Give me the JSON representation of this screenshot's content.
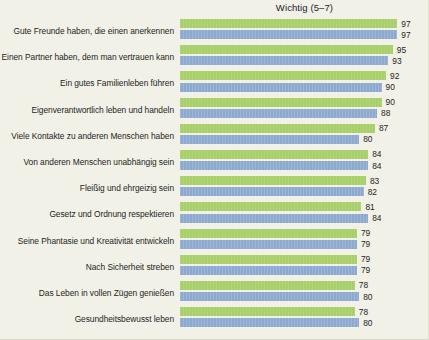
{
  "chart_data": {
    "type": "bar",
    "title": "Wichtig (5–7)",
    "xlabel": "",
    "ylabel": "",
    "orientation": "horizontal",
    "grid": false,
    "legend_position": "none",
    "xlim": [
      0,
      100
    ],
    "categories": [
      "Gute Freunde haben, die einen anerkennen",
      "Einen Partner haben, dem man vertrauen kann",
      "Ein gutes Familienleben führen",
      "Eigenverantwortlich leben und handeln",
      "Viele Kontakte zu anderen Menschen haben",
      "Von anderen Menschen unabhängig sein",
      "Fleißig und ehrgeizig sein",
      "Gesetz und Ordnung respektieren",
      "Seine Phantasie und Kreativität entwickeln",
      "Nach Sicherheit streben",
      "Das Leben in vollen Zügen genießen",
      "Gesundheitsbewusst leben"
    ],
    "series": [
      {
        "name": "green",
        "color": "#a8cf6a",
        "values": [
          97,
          95,
          92,
          90,
          87,
          84,
          83,
          81,
          79,
          79,
          78,
          78
        ]
      },
      {
        "name": "blue",
        "color": "#8da9cf",
        "values": [
          97,
          93,
          90,
          88,
          80,
          84,
          82,
          84,
          79,
          79,
          80,
          80
        ]
      }
    ]
  },
  "colors": {
    "background": "#f2f1e8",
    "green": "#a8cf6a",
    "blue": "#8da9cf",
    "text": "#1d1e1c"
  }
}
